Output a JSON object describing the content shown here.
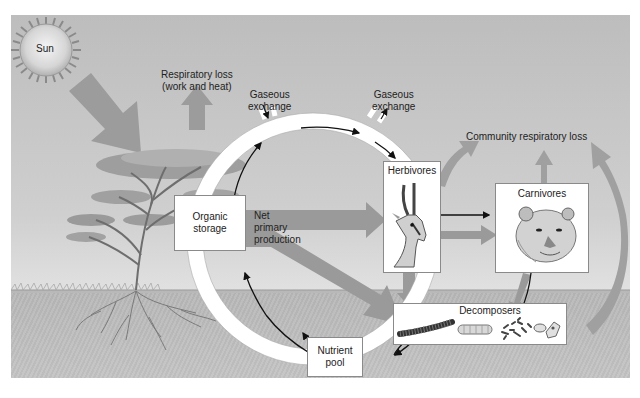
{
  "diagram": {
    "labels": {
      "sun": "Sun",
      "respiratory_loss_line1": "Respiratory loss",
      "respiratory_loss_line2": "(work and heat)",
      "gaseous_exchange_left_line1": "Gaseous",
      "gaseous_exchange_left_line2": "exchange",
      "gaseous_exchange_right_line1": "Gaseous",
      "gaseous_exchange_right_line2": "exchange",
      "community_respiratory_loss": "Community respiratory loss",
      "organic_storage_line1": "Organic",
      "organic_storage_line2": "storage",
      "net_primary_production_line1": "Net",
      "net_primary_production_line2": "primary",
      "net_primary_production_line3": "production",
      "herbivores": "Herbivores",
      "carnivores": "Carnivores",
      "decomposers": "Decomposers",
      "nutrient_pool_line1": "Nutrient",
      "nutrient_pool_line2": "pool"
    },
    "nodes": [
      {
        "id": "sun",
        "label": "Sun",
        "icon": "sun-icon"
      },
      {
        "id": "producer",
        "label": "Tree (producer)",
        "icon": "acacia-tree-icon"
      },
      {
        "id": "organic_storage",
        "label": "Organic storage"
      },
      {
        "id": "herbivores",
        "label": "Herbivores",
        "icon": "gazelle-icon"
      },
      {
        "id": "carnivores",
        "label": "Carnivores",
        "icon": "lioness-icon"
      },
      {
        "id": "decomposers",
        "label": "Decomposers",
        "icon": "millipede-larva-bacteria-icon"
      },
      {
        "id": "nutrient_pool",
        "label": "Nutrient pool"
      }
    ],
    "energy_flows": [
      {
        "from": "sun",
        "to": "producer",
        "type": "energy"
      },
      {
        "from": "producer",
        "to": "atmosphere",
        "label": "Respiratory loss (work and heat)"
      },
      {
        "from": "organic_storage",
        "to": "herbivores",
        "label": "Net primary production"
      },
      {
        "from": "organic_storage",
        "to": "decomposers"
      },
      {
        "from": "herbivores",
        "to": "carnivores"
      },
      {
        "from": "herbivores",
        "to": "decomposers"
      },
      {
        "from": "carnivores",
        "to": "decomposers"
      },
      {
        "from": "community",
        "to": "atmosphere",
        "label": "Community respiratory loss"
      }
    ],
    "nutrient_cycle": [
      "organic_storage",
      "herbivores",
      "decomposers",
      "nutrient_pool",
      "organic_storage"
    ],
    "colors": {
      "sky": "#c8c8c8",
      "ground": "#bcbcbc",
      "energy_arrow": "#9a9a9a",
      "cycle_ring": "#ffffff",
      "box_fill": "#ffffff",
      "text": "#222222"
    }
  }
}
